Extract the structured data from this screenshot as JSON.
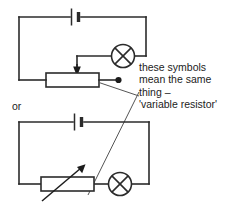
{
  "figure": {
    "kind": "circuit-diagram",
    "width": 230,
    "height": 211,
    "background_color": "#ffffff",
    "line_color": "#2b2b2b",
    "text_color": "#1c1c1c"
  },
  "labels": {
    "or": "or",
    "caption_lines": [
      "these symbols",
      "mean the same",
      "thing –",
      "'variable resistor'"
    ]
  },
  "circuits": [
    {
      "id": "top-circuit",
      "name": "rheostat-circuit",
      "components": [
        {
          "type": "battery",
          "name": "battery-cell-top"
        },
        {
          "type": "lamp",
          "name": "lamp-top"
        },
        {
          "type": "resistor-box",
          "name": "rheostat-resistor-top"
        },
        {
          "type": "wiper-arrow",
          "name": "rheostat-wiper-arrow-top"
        },
        {
          "type": "terminal-dot",
          "name": "terminal-dot-top"
        }
      ]
    },
    {
      "id": "bottom-circuit",
      "name": "variable-resistor-circuit",
      "components": [
        {
          "type": "battery",
          "name": "battery-cell-bottom"
        },
        {
          "type": "lamp",
          "name": "lamp-bottom"
        },
        {
          "type": "resistor-box",
          "name": "variable-resistor-bottom"
        },
        {
          "type": "diagonal-arrow",
          "name": "variable-resistor-arrow-bottom"
        }
      ]
    }
  ],
  "leaders": [
    {
      "name": "leader-to-rheostat",
      "from": "rheostat-resistor-top",
      "to": "caption"
    },
    {
      "name": "leader-to-variable-resistor",
      "from": "variable-resistor-bottom",
      "to": "caption"
    }
  ]
}
